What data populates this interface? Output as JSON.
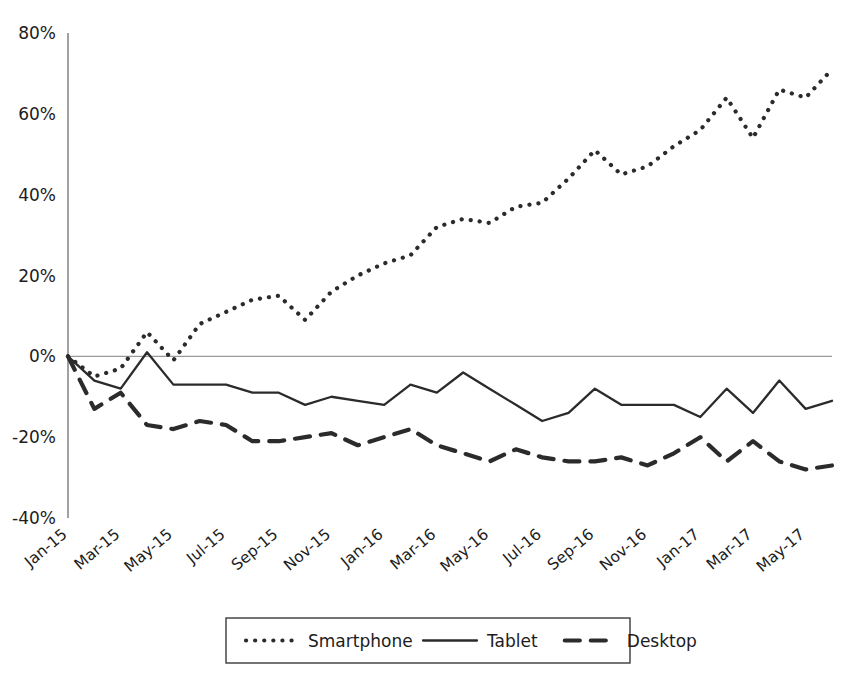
{
  "chart_data": {
    "type": "line",
    "title": "",
    "subtitle": "",
    "xlabel": "",
    "ylabel": "",
    "ylim": [
      -40,
      80
    ],
    "ytick_values": [
      80,
      60,
      40,
      20,
      0,
      -20,
      -40
    ],
    "ytick_labels": [
      "80%",
      "60%",
      "40%",
      "20%",
      "0%",
      "-20%",
      "-40%"
    ],
    "grid": false,
    "zero_line": true,
    "legend_position": "bottom",
    "x": [
      "Jan-15",
      "Feb-15",
      "Mar-15",
      "Apr-15",
      "May-15",
      "Jun-15",
      "Jul-15",
      "Aug-15",
      "Sep-15",
      "Oct-15",
      "Nov-15",
      "Dec-15",
      "Jan-16",
      "Feb-16",
      "Mar-16",
      "Apr-16",
      "May-16",
      "Jun-16",
      "Jul-16",
      "Aug-16",
      "Sep-16",
      "Oct-16",
      "Nov-16",
      "Dec-16",
      "Jan-17",
      "Feb-17",
      "Mar-17",
      "Apr-17",
      "May-17",
      "Jun-17"
    ],
    "xtick_labels": [
      "Jan-15",
      "Mar-15",
      "May-15",
      "Jul-15",
      "Sep-15",
      "Nov-15",
      "Jan-16",
      "Mar-16",
      "May-16",
      "Jul-16",
      "Sep-16",
      "Nov-16",
      "Jan-17",
      "Mar-17",
      "May-17"
    ],
    "xtick_indices": [
      0,
      2,
      4,
      6,
      8,
      10,
      12,
      14,
      16,
      18,
      20,
      22,
      24,
      26,
      28
    ],
    "series": [
      {
        "name": "Smartphone",
        "style": "dotted",
        "color": "#2b2b2b",
        "values": [
          0,
          -5,
          -3,
          6,
          -1,
          8,
          11,
          14,
          15,
          9,
          16,
          20,
          23,
          25,
          32,
          34,
          33,
          37,
          38,
          44,
          51,
          45,
          47,
          52,
          56,
          64,
          54,
          66,
          64,
          71
        ]
      },
      {
        "name": "Tablet",
        "style": "solid",
        "color": "#2b2b2b",
        "values": [
          0,
          -6,
          -8,
          1,
          -7,
          -7,
          -7,
          -9,
          -9,
          -12,
          -10,
          -11,
          -12,
          -7,
          -9,
          -4,
          -8,
          -12,
          -16,
          -14,
          -8,
          -12,
          -12,
          -12,
          -15,
          -8,
          -14,
          -6,
          -13,
          -11
        ]
      },
      {
        "name": "Desktop",
        "style": "dashed",
        "color": "#2b2b2b",
        "values": [
          0,
          -13,
          -9,
          -17,
          -18,
          -16,
          -17,
          -21,
          -21,
          -20,
          -19,
          -22,
          -20,
          -18,
          -22,
          -24,
          -26,
          -23,
          -25,
          -26,
          -26,
          -25,
          -27,
          -24,
          -20,
          -26,
          -21,
          -26,
          -28,
          -27
        ]
      }
    ]
  },
  "axes": {
    "plot_left": 68,
    "plot_right": 832,
    "plot_top": 33,
    "plot_bottom": 518
  },
  "legend": {
    "items": [
      {
        "label": "Smartphone",
        "style": "dotted"
      },
      {
        "label": "Tablet",
        "style": "solid"
      },
      {
        "label": "Desktop",
        "style": "dashed"
      }
    ]
  }
}
